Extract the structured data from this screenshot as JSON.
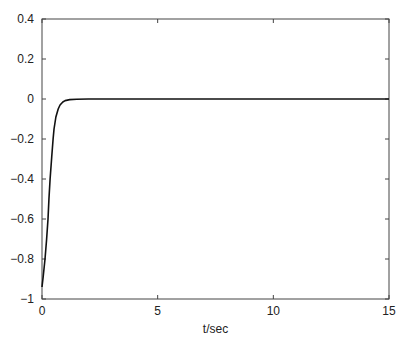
{
  "chart_data": {
    "type": "line",
    "title": "",
    "xlabel": "t/sec",
    "ylabel": "",
    "xlim": [
      0,
      15
    ],
    "ylim": [
      -1,
      0.4
    ],
    "xticks": [
      0,
      5,
      10,
      15
    ],
    "xtick_labels": [
      "0",
      "5",
      "10",
      "15"
    ],
    "yticks": [
      0.4,
      0.2,
      0,
      -0.2,
      -0.4,
      -0.6,
      -0.8,
      -1
    ],
    "ytick_labels": [
      "0.4",
      "0.2",
      "0",
      "−0.2",
      "−0.4",
      "−0.6",
      "−0.8",
      "−1"
    ],
    "grid": false,
    "legend": null,
    "series": [
      {
        "name": "response",
        "color": "#111111",
        "x": [
          0,
          0.05,
          0.13,
          0.2,
          0.26,
          0.3,
          0.35,
          0.42,
          0.48,
          0.52,
          0.6,
          0.7,
          0.78,
          0.9,
          1.0,
          1.2,
          1.5,
          2.0,
          3.0,
          5.0,
          10.0,
          15.0
        ],
        "y": [
          -0.94,
          -0.89,
          -0.8,
          -0.7,
          -0.6,
          -0.5,
          -0.4,
          -0.29,
          -0.2,
          -0.15,
          -0.09,
          -0.05,
          -0.03,
          -0.015,
          -0.008,
          -0.003,
          -0.001,
          0,
          0,
          0,
          0,
          0
        ]
      }
    ]
  }
}
